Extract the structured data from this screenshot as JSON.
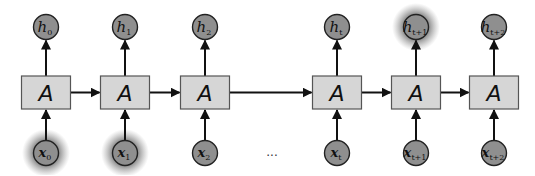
{
  "diagram": {
    "cell_label": "A",
    "ellipsis": "...",
    "steps": [
      {
        "cx": 46,
        "h_main": "h",
        "h_sub": "0",
        "x_main": "x",
        "x_sub": "0",
        "h_glow": false,
        "x_glow": true
      },
      {
        "cx": 125,
        "h_main": "h",
        "h_sub": "1",
        "x_main": "x",
        "x_sub": "1",
        "h_glow": false,
        "x_glow": true
      },
      {
        "cx": 205,
        "h_main": "h",
        "h_sub": "2",
        "x_main": "x",
        "x_sub": "2",
        "h_glow": false,
        "x_glow": false
      },
      {
        "cx": 337,
        "h_main": "h",
        "h_sub": "t",
        "x_main": "x",
        "x_sub": "t",
        "h_glow": false,
        "x_glow": false
      },
      {
        "cx": 416,
        "h_main": "h",
        "h_sub": "t+1",
        "x_main": "x",
        "x_sub": "t+1",
        "h_glow": true,
        "x_glow": false
      },
      {
        "cx": 494,
        "h_main": "h",
        "h_sub": "t+2",
        "x_main": "x",
        "x_sub": "t+2",
        "h_glow": false,
        "x_glow": false
      }
    ],
    "colors": {
      "box_fill": "#d6d6d6",
      "node_fill": "#8f8f8f",
      "glow": "#555555",
      "line": "#111111"
    }
  }
}
